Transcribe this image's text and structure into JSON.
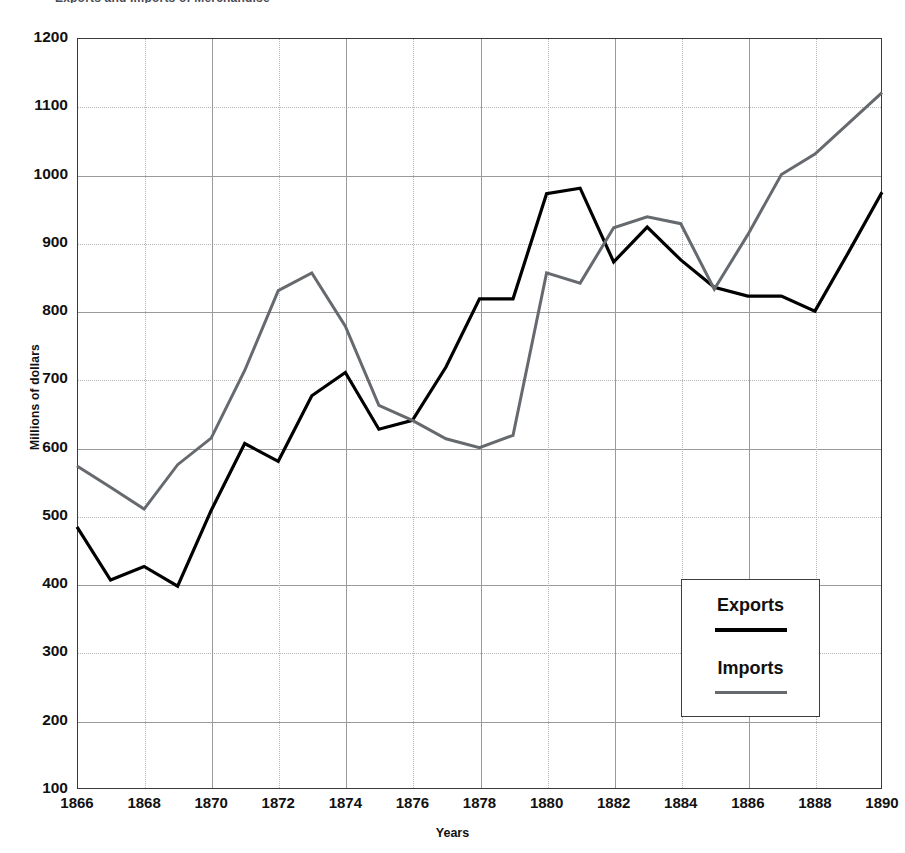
{
  "chart_data": {
    "type": "line",
    "title": "Exports and Imports of Merchandise",
    "xlabel": "Years",
    "ylabel": "Millions of dollars",
    "xlim": [
      1866,
      1890
    ],
    "ylim": [
      100,
      1200
    ],
    "grid": true,
    "legend_position": "inside-bottom-right",
    "x": [
      1866,
      1867,
      1868,
      1869,
      1870,
      1871,
      1872,
      1873,
      1874,
      1875,
      1876,
      1877,
      1878,
      1879,
      1880,
      1881,
      1882,
      1883,
      1884,
      1885,
      1886,
      1887,
      1888,
      1889,
      1890
    ],
    "xtick_labels": [
      "1866",
      "1868",
      "1870",
      "1872",
      "1874",
      "1876",
      "1878",
      "1880",
      "1882",
      "1884",
      "1886",
      "1888",
      "1890"
    ],
    "xtick_values": [
      1866,
      1868,
      1870,
      1872,
      1874,
      1876,
      1878,
      1880,
      1882,
      1884,
      1886,
      1888,
      1890
    ],
    "ytick_labels": [
      "100",
      "200",
      "300",
      "400",
      "500",
      "600",
      "700",
      "800",
      "900",
      "1000",
      "1100",
      "1200"
    ],
    "ytick_values": [
      100,
      200,
      300,
      400,
      500,
      600,
      700,
      800,
      900,
      1000,
      1100,
      1200
    ],
    "series": [
      {
        "name": "Exports",
        "color": "#000000",
        "width": 3.2,
        "values": [
          484,
          406,
          426,
          397,
          508,
          606,
          580,
          676,
          710,
          627,
          640,
          718,
          818,
          818,
          972,
          980,
          872,
          923,
          875,
          835,
          822,
          822,
          800,
          886,
          974
        ]
      },
      {
        "name": "Imports",
        "color": "#666a6e",
        "width": 3.0,
        "values": [
          573,
          542,
          510,
          575,
          614,
          713,
          830,
          856,
          778,
          662,
          640,
          613,
          600,
          618,
          856,
          841,
          922,
          938,
          928,
          832,
          912,
          1000,
          1030,
          1075,
          1120
        ]
      }
    ]
  },
  "legend": {
    "entries": [
      {
        "label": "Exports"
      },
      {
        "label": "Imports"
      }
    ]
  }
}
